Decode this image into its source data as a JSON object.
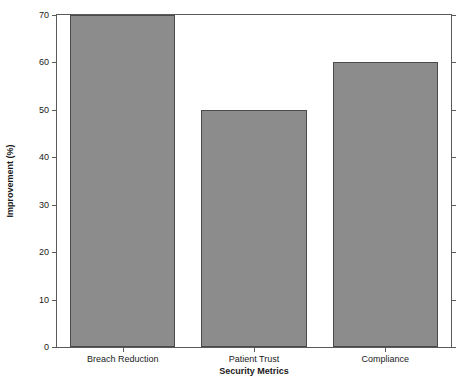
{
  "chart_data": {
    "type": "bar",
    "title": "",
    "categories": [
      "Breach Reduction",
      "Patient Trust",
      "Compliance"
    ],
    "values": [
      70,
      50,
      60
    ],
    "xlabel": "Security Metrics",
    "ylabel": "Improvement (%)",
    "ylim": [
      0,
      70
    ],
    "ytick_labels": [
      "0",
      "10",
      "20",
      "30",
      "40",
      "50",
      "60",
      "70"
    ],
    "ytick_values": [
      0,
      10,
      20,
      30,
      40,
      50,
      60,
      70
    ],
    "grid": false,
    "legend": null,
    "bar_color": "#8c8c8c",
    "bar_edge_color": "#4a4a4a",
    "axis_color": "#5a5a5a",
    "background_color": "#ffffff"
  }
}
